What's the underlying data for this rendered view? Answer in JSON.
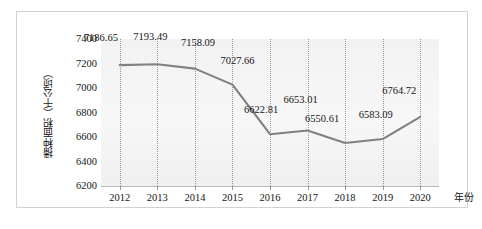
{
  "chart_data": {
    "type": "line",
    "title": "",
    "subtitle": "",
    "xlabel": "年份",
    "ylabel": "播种面积（千公顷）",
    "categories": [
      "2012",
      "2013",
      "2014",
      "2015",
      "2016",
      "2017",
      "2018",
      "2019",
      "2020"
    ],
    "values": [
      7186.65,
      7193.49,
      7158.09,
      7027.66,
      6622.81,
      6653.01,
      6550.61,
      6583.09,
      6764.72
    ],
    "data_labels": [
      "7186.65",
      "7193.49",
      "7158.09",
      "7027.66",
      "6622.81",
      "6653.01",
      "6550.61",
      "6583.09",
      "6764.72"
    ],
    "ylim": [
      6200,
      7400
    ],
    "yticks": [
      7400,
      7200,
      7000,
      6800,
      6600,
      6400,
      6200
    ],
    "ytick_labels": [
      "7400",
      "7200",
      "7000",
      "6800",
      "6600",
      "6400",
      "6200"
    ],
    "grid": "vertical-dotted",
    "legend": "none",
    "series_color": "#808080",
    "plot_background": "#f4f4f4",
    "frame_color": "#d2d2d2"
  },
  "axes": {
    "y_title": "播种面积（千公顷）",
    "x_title": "年份"
  }
}
